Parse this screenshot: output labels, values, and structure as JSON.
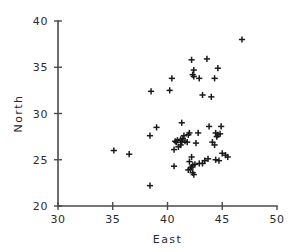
{
  "chart_data": {
    "type": "scatter",
    "title": "",
    "xlabel": "East",
    "ylabel": "North",
    "xlim": [
      30,
      50
    ],
    "ylim": [
      20,
      40
    ],
    "xticks": [
      30,
      35,
      40,
      45,
      50
    ],
    "yticks": [
      20,
      25,
      30,
      35,
      40
    ],
    "xtick_labels": [
      "30",
      "35",
      "40",
      "45",
      "50"
    ],
    "ytick_labels": [
      "20",
      "25",
      "30",
      "35",
      "40"
    ],
    "grid": false,
    "legend": false,
    "marker": "plus",
    "marker_color": "#1a1a1a",
    "n_points": 63,
    "points": [
      [
        46.8,
        38.0
      ],
      [
        42.2,
        35.8
      ],
      [
        43.6,
        35.9
      ],
      [
        44.6,
        34.9
      ],
      [
        42.4,
        34.7
      ],
      [
        42.3,
        34.2
      ],
      [
        42.4,
        34.0
      ],
      [
        40.4,
        33.8
      ],
      [
        42.9,
        33.8
      ],
      [
        44.3,
        33.8
      ],
      [
        38.5,
        32.4
      ],
      [
        40.2,
        32.5
      ],
      [
        43.2,
        32.0
      ],
      [
        44.0,
        31.8
      ],
      [
        41.3,
        29.0
      ],
      [
        39.0,
        28.5
      ],
      [
        43.8,
        28.6
      ],
      [
        44.9,
        28.6
      ],
      [
        38.4,
        27.6
      ],
      [
        44.4,
        27.9
      ],
      [
        44.6,
        27.7
      ],
      [
        44.5,
        27.5
      ],
      [
        42.0,
        27.9
      ],
      [
        41.9,
        27.7
      ],
      [
        41.5,
        27.6
      ],
      [
        41.4,
        27.3
      ],
      [
        41.2,
        27.2
      ],
      [
        40.9,
        27.1
      ],
      [
        40.7,
        27.0
      ],
      [
        41.6,
        27.0
      ],
      [
        41.8,
        26.9
      ],
      [
        42.6,
        26.8
      ],
      [
        44.1,
        26.9
      ],
      [
        44.3,
        26.6
      ],
      [
        41.2,
        26.6
      ],
      [
        41.0,
        26.4
      ],
      [
        40.6,
        26.1
      ],
      [
        35.1,
        26.0
      ],
      [
        36.5,
        25.6
      ],
      [
        45.0,
        25.7
      ],
      [
        45.3,
        25.5
      ],
      [
        45.5,
        25.3
      ],
      [
        42.2,
        25.3
      ],
      [
        43.7,
        25.1
      ],
      [
        44.4,
        25.0
      ],
      [
        44.7,
        24.9
      ],
      [
        43.2,
        24.6
      ],
      [
        42.9,
        24.6
      ],
      [
        42.5,
        24.5
      ],
      [
        42.3,
        24.4
      ],
      [
        42.2,
        24.2
      ],
      [
        42.1,
        24.0
      ],
      [
        41.9,
        23.9
      ],
      [
        42.3,
        23.6
      ],
      [
        42.4,
        23.4
      ],
      [
        40.6,
        24.3
      ],
      [
        38.4,
        22.2
      ],
      [
        43.4,
        24.9
      ],
      [
        41.3,
        26.9
      ],
      [
        42.8,
        27.9
      ],
      [
        44.8,
        27.8
      ],
      [
        40.8,
        26.9
      ],
      [
        42.0,
        24.8
      ]
    ]
  },
  "axes": {
    "x_title": "East",
    "y_title": "North"
  }
}
